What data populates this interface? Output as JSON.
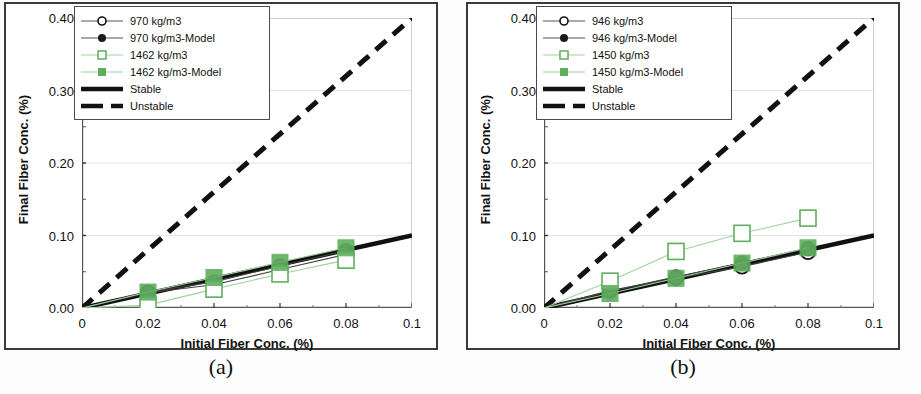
{
  "figure": {
    "panels": [
      {
        "caption": "(a)",
        "xlabel": "Initial Fiber Conc. (%)",
        "ylabel": "Final Fiber Conc. (%)",
        "legend": [
          {
            "label": "970 kg/m3",
            "key": "line-open-circle"
          },
          {
            "label": "970 kg/m3-Model",
            "key": "line-filled-circle"
          },
          {
            "label": "1462 kg/m3",
            "key": "greenline-open-square"
          },
          {
            "label": "1462 kg/m3-Model",
            "key": "greenline-filled-square"
          },
          {
            "label": "Stable",
            "key": "thick-solid-line"
          },
          {
            "label": "Unstable",
            "key": "thick-dashed-line"
          }
        ]
      },
      {
        "caption": "(b)",
        "xlabel": "Initial Fiber Conc. (%)",
        "ylabel": "Final Fiber Conc. (%)",
        "legend": [
          {
            "label": "946 kg/m3",
            "key": "line-open-circle"
          },
          {
            "label": "946 kg/m3-Model",
            "key": "line-filled-circle"
          },
          {
            "label": "1450 kg/m3",
            "key": "greenline-open-square"
          },
          {
            "label": "1450 kg/m3-Model",
            "key": "greenline-filled-square"
          },
          {
            "label": "Stable",
            "key": "thick-solid-line"
          },
          {
            "label": "Unstable",
            "key": "thick-dashed-line"
          }
        ]
      }
    ]
  },
  "colors": {
    "green": "#5fae5f",
    "green_light": "#9ed39e",
    "black": "#111111",
    "frame": "#3a3a3a",
    "grid": "#e2e2e2"
  },
  "chart_data": [
    {
      "type": "scatter",
      "panel": "(a)",
      "title": "",
      "xlabel": "Initial Fiber Conc. (%)",
      "ylabel": "Final Fiber Conc. (%)",
      "xlim": [
        0,
        0.1
      ],
      "ylim": [
        0,
        0.4
      ],
      "xticks": [
        0,
        0.02,
        0.04,
        0.06,
        0.08,
        0.1
      ],
      "xticklabels": [
        "0",
        "0.02",
        "0.04",
        "0.06",
        "0.08",
        "0.1"
      ],
      "yticks": [
        0.0,
        0.1,
        0.2,
        0.3,
        0.4
      ],
      "yticklabels": [
        "0.00",
        "0.10",
        "0.20",
        "0.30",
        "0.40"
      ],
      "grid": true,
      "legend_position": "upper-left",
      "x": [
        0.02,
        0.04,
        0.06,
        0.08
      ],
      "series": [
        {
          "name": "970 kg/m3",
          "marker": "open-circle",
          "color": "#111111",
          "values": [
            0.021,
            0.032,
            0.053,
            0.074
          ]
        },
        {
          "name": "970 kg/m3-Model",
          "marker": "filled-circle",
          "color": "#111111",
          "values": [
            0.022,
            0.036,
            0.058,
            0.079
          ]
        },
        {
          "name": "1462 kg/m3",
          "marker": "open-square",
          "color": "#5fae5f",
          "values": [
            0.004,
            0.026,
            0.047,
            0.066
          ]
        },
        {
          "name": "1462 kg/m3-Model",
          "marker": "filled-square",
          "color": "#5fae5f",
          "values": [
            0.022,
            0.042,
            0.063,
            0.083
          ]
        }
      ],
      "reference_lines": [
        {
          "name": "Stable",
          "style": "solid",
          "slope": 1.0,
          "x": [
            0,
            0.1
          ],
          "y": [
            0,
            0.1
          ]
        },
        {
          "name": "Unstable",
          "style": "dashed",
          "slope": 4.0,
          "x": [
            0,
            0.1
          ],
          "y": [
            0,
            0.4
          ]
        }
      ]
    },
    {
      "type": "scatter",
      "panel": "(b)",
      "title": "",
      "xlabel": "Initial Fiber Conc. (%)",
      "ylabel": "Final Fiber Conc. (%)",
      "xlim": [
        0,
        0.1
      ],
      "ylim": [
        0,
        0.4
      ],
      "xticks": [
        0,
        0.02,
        0.04,
        0.06,
        0.08,
        0.1
      ],
      "xticklabels": [
        "0",
        "0.02",
        "0.04",
        "0.06",
        "0.08",
        "0.1"
      ],
      "yticks": [
        0.0,
        0.1,
        0.2,
        0.3,
        0.4
      ],
      "yticklabels": [
        "0.00",
        "0.10",
        "0.20",
        "0.30",
        "0.40"
      ],
      "grid": true,
      "legend_position": "upper-left",
      "x": [
        0.02,
        0.04,
        0.06,
        0.08
      ],
      "series": [
        {
          "name": "946 kg/m3",
          "marker": "open-circle",
          "color": "#111111",
          "values": [
            0.024,
            0.041,
            0.057,
            0.077
          ]
        },
        {
          "name": "946 kg/m3-Model",
          "marker": "filled-circle",
          "color": "#111111",
          "values": [
            0.023,
            0.043,
            0.062,
            0.082
          ]
        },
        {
          "name": "1450 kg/m3",
          "marker": "open-square",
          "color": "#5fae5f",
          "values": [
            0.037,
            0.078,
            0.103,
            0.124
          ]
        },
        {
          "name": "1450 kg/m3-Model",
          "marker": "filled-square",
          "color": "#5fae5f",
          "values": [
            0.02,
            0.041,
            0.062,
            0.083
          ]
        }
      ],
      "reference_lines": [
        {
          "name": "Stable",
          "style": "solid",
          "slope": 1.0,
          "x": [
            0,
            0.1
          ],
          "y": [
            0,
            0.1
          ]
        },
        {
          "name": "Unstable",
          "style": "dashed",
          "slope": 4.0,
          "x": [
            0,
            0.1
          ],
          "y": [
            0,
            0.4
          ]
        }
      ]
    }
  ]
}
